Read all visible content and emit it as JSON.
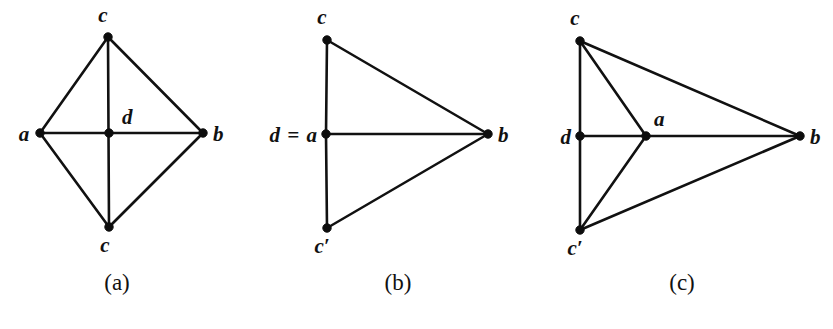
{
  "figure": {
    "background_color": "#ffffff",
    "ink_color": "#111111",
    "panels": [
      {
        "id": "panel-a",
        "caption": "(a)",
        "caption_pos": {
          "x": 117,
          "y": 290
        },
        "vertices": [
          {
            "id": "c_top",
            "label": "c",
            "x": 108,
            "y": 37,
            "label_x": 103,
            "label_y": 22,
            "anchor": "middle"
          },
          {
            "id": "a",
            "label": "a",
            "x": 40,
            "y": 133,
            "label_x": 24,
            "label_y": 141,
            "anchor": "middle"
          },
          {
            "id": "d_center",
            "label": "d",
            "x": 109,
            "y": 133,
            "label_x": 122,
            "label_y": 124,
            "anchor": "start"
          },
          {
            "id": "b",
            "label": "b",
            "x": 203,
            "y": 133,
            "label_x": 213,
            "label_y": 141,
            "anchor": "start"
          },
          {
            "id": "c_bottom",
            "label": "c",
            "x": 109,
            "y": 227,
            "label_x": 105,
            "label_y": 252,
            "anchor": "middle"
          }
        ],
        "edges": [
          {
            "from": "c_top",
            "to": "a"
          },
          {
            "from": "c_top",
            "to": "b"
          },
          {
            "from": "a",
            "to": "c_bottom"
          },
          {
            "from": "b",
            "to": "c_bottom"
          },
          {
            "from": "a",
            "to": "b"
          },
          {
            "from": "c_top",
            "to": "c_bottom"
          }
        ]
      },
      {
        "id": "panel-b",
        "caption": "(b)",
        "caption_pos": {
          "x": 398,
          "y": 290
        },
        "vertices": [
          {
            "id": "c",
            "label": "c",
            "x": 327,
            "y": 40,
            "label_x": 322,
            "label_y": 24,
            "anchor": "middle"
          },
          {
            "id": "da",
            "label": "d = a",
            "x": 326,
            "y": 134,
            "label_x": 318,
            "label_y": 142,
            "anchor": "end"
          },
          {
            "id": "b",
            "label": "b",
            "x": 488,
            "y": 134,
            "label_x": 498,
            "label_y": 142,
            "anchor": "start"
          },
          {
            "id": "cprime",
            "label": "c′",
            "x": 327,
            "y": 228,
            "label_x": 322,
            "label_y": 253,
            "anchor": "middle"
          }
        ],
        "edges": [
          {
            "from": "c",
            "to": "da"
          },
          {
            "from": "c",
            "to": "b"
          },
          {
            "from": "da",
            "to": "b"
          },
          {
            "from": "da",
            "to": "cprime"
          },
          {
            "from": "cprime",
            "to": "b"
          }
        ]
      },
      {
        "id": "panel-c",
        "caption": "(c)",
        "caption_pos": {
          "x": 682,
          "y": 290
        },
        "vertices": [
          {
            "id": "c",
            "label": "c",
            "x": 580,
            "y": 41,
            "label_x": 575,
            "label_y": 25,
            "anchor": "middle"
          },
          {
            "id": "d",
            "label": "d",
            "x": 580,
            "y": 136,
            "label_x": 571,
            "label_y": 144,
            "anchor": "end"
          },
          {
            "id": "a",
            "label": "a",
            "x": 646,
            "y": 136,
            "label_x": 654,
            "label_y": 126,
            "anchor": "start"
          },
          {
            "id": "b",
            "label": "b",
            "x": 800,
            "y": 136,
            "label_x": 810,
            "label_y": 144,
            "anchor": "start"
          },
          {
            "id": "cprime",
            "label": "c′",
            "x": 580,
            "y": 230,
            "label_x": 575,
            "label_y": 255,
            "anchor": "middle"
          }
        ],
        "edges": [
          {
            "from": "c",
            "to": "d"
          },
          {
            "from": "c",
            "to": "a"
          },
          {
            "from": "c",
            "to": "b"
          },
          {
            "from": "d",
            "to": "a"
          },
          {
            "from": "a",
            "to": "b"
          },
          {
            "from": "d",
            "to": "cprime"
          },
          {
            "from": "a",
            "to": "cprime"
          },
          {
            "from": "cprime",
            "to": "b"
          }
        ]
      }
    ]
  }
}
